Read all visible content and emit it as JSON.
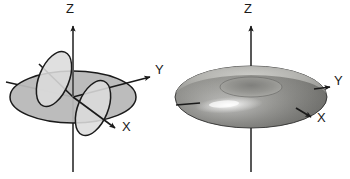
{
  "figure": {
    "title": "",
    "background_color": "#ffffff",
    "width": 350,
    "height": 179,
    "panels": [
      {
        "id": "left-panel",
        "name": "intersecting-circles-diagram",
        "description": "Three mutually perpendicular circles on 3D axes",
        "axes": {
          "z": {
            "label": "Z",
            "label_x": 70,
            "label_y": 13
          },
          "y": {
            "label": "Y",
            "label_x": 155,
            "label_y": 74
          },
          "x": {
            "label": "X",
            "label_x": 122,
            "label_y": 131
          }
        },
        "origin": {
          "x": 73,
          "y": 97
        },
        "colors": {
          "disk_fill": "#b8b8b8",
          "ring_fill": "#d9d9d9",
          "stroke": "#1a1a1a",
          "axis": "#4a4a4a"
        }
      },
      {
        "id": "right-panel",
        "name": "torus-diagram",
        "description": "Shaded torus (donut) on 3D axes",
        "axes": {
          "z": {
            "label": "Z",
            "label_x": 248,
            "label_y": 13
          },
          "y": {
            "label": "Y",
            "label_x": 334,
            "label_y": 85
          },
          "x": {
            "label": "X",
            "label_x": 317,
            "label_y": 122
          }
        },
        "origin": {
          "x": 251,
          "y": 97
        },
        "colors": {
          "torus_light": "#f0f0ee",
          "torus_mid": "#a9a9a5",
          "torus_dark": "#6e6e6c",
          "stroke": "#1a1a1a",
          "axis": "#4a4a4a"
        }
      }
    ]
  }
}
